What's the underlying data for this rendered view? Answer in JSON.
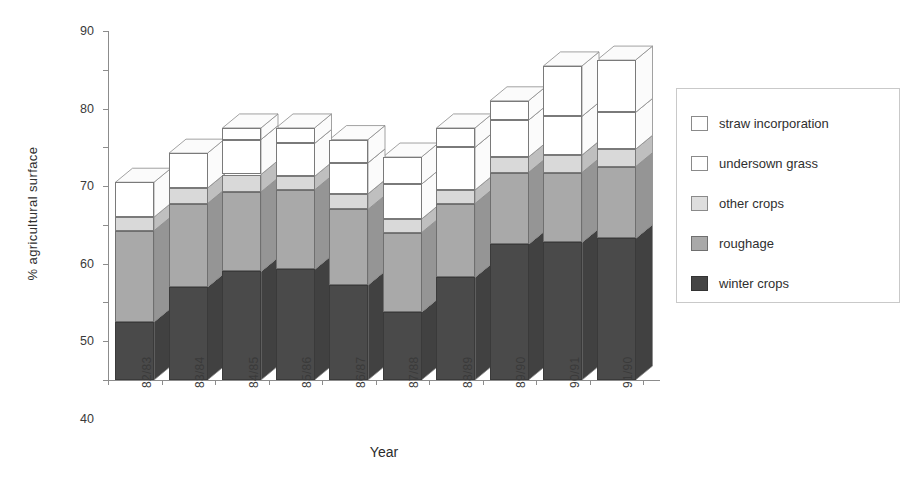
{
  "chart_data": {
    "type": "bar",
    "subtype": "stacked-3d",
    "title": "",
    "xlabel": "Year",
    "ylabel": "% agricultural surface",
    "ylim": [
      0,
      90
    ],
    "ytick_step": 10,
    "yticks": [
      0,
      10,
      20,
      30,
      40,
      50,
      60,
      70,
      80,
      90
    ],
    "grid": false,
    "legend_position": "right",
    "categories": [
      "82/83",
      "83/84",
      "84/85",
      "85/86",
      "86/87",
      "87/88",
      "88/89",
      "89/90",
      "90/91",
      "91/90"
    ],
    "series": [
      {
        "name": "winter crops",
        "color": "#4a4a4a",
        "values": [
          15.0,
          24.0,
          28.0,
          28.5,
          24.5,
          17.5,
          26.5,
          35.0,
          35.5,
          36.5
        ]
      },
      {
        "name": "roughage",
        "color": "#a9a9a9",
        "values": [
          23.5,
          21.5,
          20.5,
          20.5,
          19.5,
          20.5,
          19.0,
          18.5,
          18.0,
          18.5
        ]
      },
      {
        "name": "other crops",
        "color": "#d9d9d9",
        "values": [
          3.5,
          4.0,
          4.5,
          3.5,
          4.0,
          3.5,
          3.5,
          4.0,
          4.5,
          4.5
        ]
      },
      {
        "name": "undersown grass",
        "color": "#ffffff",
        "values": [
          0.0,
          0.0,
          9.0,
          8.5,
          8.0,
          9.0,
          11.0,
          9.5,
          10.0,
          9.5
        ]
      },
      {
        "name": "straw incorporation",
        "color": "#ffffff",
        "values": [
          9.0,
          9.0,
          3.0,
          4.0,
          6.0,
          7.0,
          5.0,
          5.0,
          13.0,
          13.5
        ]
      }
    ],
    "cumulative_tops": [
      [
        15.0,
        38.5,
        42.0,
        42.0,
        51.0
      ],
      [
        24.0,
        45.5,
        49.5,
        49.5,
        58.5
      ],
      [
        28.0,
        48.5,
        53.0,
        62.0,
        65.0
      ],
      [
        28.5,
        49.0,
        52.5,
        61.0,
        65.0
      ],
      [
        24.5,
        44.0,
        48.0,
        56.0,
        62.0
      ],
      [
        17.5,
        38.0,
        41.5,
        50.5,
        57.5
      ],
      [
        26.5,
        45.5,
        49.0,
        60.0,
        65.0
      ],
      [
        35.0,
        53.5,
        57.5,
        67.0,
        72.0
      ],
      [
        35.5,
        53.5,
        58.0,
        68.0,
        81.0
      ],
      [
        36.5,
        55.0,
        59.5,
        69.0,
        82.5
      ]
    ],
    "totals": [
      51.0,
      58.5,
      65.0,
      65.0,
      62.0,
      57.5,
      65.0,
      72.0,
      81.0,
      82.5
    ]
  },
  "axes": {
    "y_title": "% agricultural surface",
    "x_title": "Year",
    "y_tick_labels": [
      "90",
      "80",
      "70",
      "60",
      "50",
      "40",
      "30",
      "20",
      "10",
      "0"
    ],
    "x_tick_labels": [
      "82/83",
      "83/84",
      "84/85",
      "85/86",
      "86/87",
      "87/88",
      "88/89",
      "89/90",
      "90/91",
      "91/90"
    ]
  },
  "legend": {
    "items": [
      {
        "label": "straw incorporation",
        "swatch": "sw-straw"
      },
      {
        "label": "undersown grass",
        "swatch": "sw-undersown"
      },
      {
        "label": "other crops",
        "swatch": "sw-other"
      },
      {
        "label": "roughage",
        "swatch": "sw-roughage"
      },
      {
        "label": "winter crops",
        "swatch": "sw-winter"
      }
    ]
  },
  "colors": {
    "winter_crops": "#4a4a4a",
    "roughage": "#a9a9a9",
    "other_crops": "#d9d9d9",
    "undersown_grass": "#ffffff",
    "straw_incorporation": "#ffffff",
    "axis": "#8c8c8c",
    "text": "#2b2b2b"
  }
}
